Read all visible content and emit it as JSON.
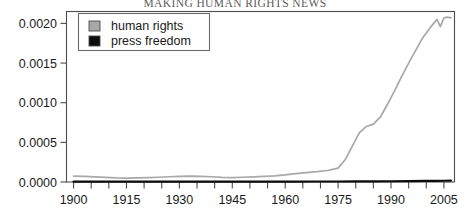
{
  "chart_data": {
    "type": "line",
    "title": "MAKING HUMAN RIGHTS NEWS",
    "xlabel": "",
    "ylabel": "",
    "xlim": [
      1898,
      2008
    ],
    "ylim": [
      0.0,
      0.00215
    ],
    "grid": false,
    "legend_position": "top-left",
    "xticks": [
      1900,
      1915,
      1930,
      1945,
      1960,
      1975,
      1990,
      2005
    ],
    "xtick_labels": [
      "1900",
      "1915",
      "1930",
      "1945",
      "1960",
      "1975",
      "1990",
      "2005"
    ],
    "xminor_step": 5,
    "yticks": [
      0.0,
      0.0005,
      0.001,
      0.0015,
      0.002
    ],
    "ytick_labels": [
      "0.0000",
      "0.0005",
      "0.0010",
      "0.0015",
      "0.0020"
    ],
    "series": [
      {
        "name": "human rights",
        "color": "#a8a8a8",
        "x": [
          1900,
          1903,
          1906,
          1909,
          1912,
          1915,
          1918,
          1921,
          1924,
          1927,
          1930,
          1933,
          1936,
          1939,
          1942,
          1945,
          1948,
          1951,
          1954,
          1957,
          1960,
          1963,
          1966,
          1969,
          1972,
          1975,
          1977,
          1979,
          1981,
          1983,
          1985,
          1987,
          1989,
          1991,
          1993,
          1995,
          1997,
          1999,
          2001,
          2003,
          2004,
          2005,
          2006,
          2007
        ],
        "values": [
          7.5e-05,
          7.2e-05,
          6.5e-05,
          5.8e-05,
          5.2e-05,
          5e-05,
          5.2e-05,
          5.5e-05,
          6e-05,
          6.6e-05,
          7.2e-05,
          7.4e-05,
          7.2e-05,
          6.6e-05,
          5.8e-05,
          5.6e-05,
          6e-05,
          6.4e-05,
          7e-05,
          7.8e-05,
          9e-05,
          0.000105,
          0.000118,
          0.00013,
          0.000145,
          0.000175,
          0.00028,
          0.00045,
          0.00062,
          0.0007,
          0.00073,
          0.00082,
          0.00098,
          0.00115,
          0.00133,
          0.0015,
          0.00166,
          0.00182,
          0.00194,
          0.00205,
          0.00196,
          0.00207,
          0.00208,
          0.00207
        ]
      },
      {
        "name": "press freedom",
        "color": "#0d0d0d",
        "x": [
          1900,
          1910,
          1920,
          1930,
          1940,
          1950,
          1960,
          1970,
          1975,
          1980,
          1985,
          1990,
          1995,
          2000,
          2003,
          2005,
          2007
        ],
        "values": [
          4.5e-06,
          4e-06,
          4.2e-06,
          4.8e-06,
          4.5e-06,
          5e-06,
          5.5e-06,
          6e-06,
          6.5e-06,
          7.2e-06,
          8e-06,
          9.5e-06,
          1.1e-05,
          1.3e-05,
          1.45e-05,
          1.6e-05,
          1.7e-05
        ]
      }
    ]
  },
  "legend": {
    "entries": [
      {
        "label": "human rights",
        "swatch_color": "#a8a8a8"
      },
      {
        "label": "press freedom",
        "swatch_color": "#0d0d0d"
      }
    ]
  }
}
